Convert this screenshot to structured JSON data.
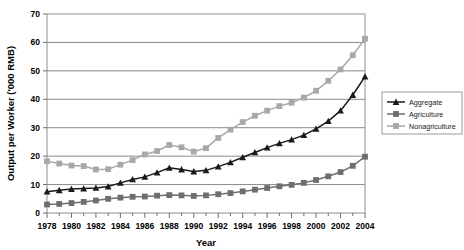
{
  "chart_data": {
    "type": "line",
    "title": "",
    "xlabel": "Year",
    "ylabel": "Output per Worker ('000 RMB)",
    "xlim": [
      1978,
      2004
    ],
    "ylim": [
      0,
      70
    ],
    "ytick_step": 10,
    "xtick_step": 2,
    "grid": true,
    "legend_position": "right",
    "x": [
      1978,
      1979,
      1980,
      1981,
      1982,
      1983,
      1984,
      1985,
      1986,
      1987,
      1988,
      1989,
      1990,
      1991,
      1992,
      1993,
      1994,
      1995,
      1996,
      1997,
      1998,
      1999,
      2000,
      2001,
      2002,
      2003,
      2004
    ],
    "xtick_labels": [
      "1978",
      "1980",
      "1982",
      "1984",
      "1986",
      "1988",
      "1990",
      "1992",
      "1994",
      "1996",
      "1998",
      "2000",
      "2002",
      "2004"
    ],
    "ytick_labels": [
      "0",
      "10",
      "20",
      "30",
      "40",
      "50",
      "60",
      "70"
    ],
    "series": [
      {
        "name": "Aggregate",
        "color": "#1a1a1a",
        "marker": "triangle",
        "values": [
          7.5,
          8.0,
          8.4,
          8.6,
          8.8,
          9.3,
          10.6,
          11.8,
          12.7,
          14.2,
          15.9,
          15.3,
          14.6,
          15.0,
          16.3,
          17.8,
          19.6,
          21.3,
          23.0,
          24.5,
          25.8,
          27.4,
          29.6,
          32.3,
          36.0,
          41.5,
          48.0
        ]
      },
      {
        "name": "Agriculture",
        "color": "#6e6e6e",
        "marker": "square",
        "values": [
          3.0,
          3.2,
          3.5,
          3.9,
          4.4,
          5.0,
          5.4,
          5.7,
          5.8,
          6.1,
          6.3,
          6.2,
          6.0,
          6.2,
          6.6,
          7.0,
          7.6,
          8.2,
          8.8,
          9.4,
          9.9,
          10.6,
          11.6,
          12.9,
          14.4,
          16.6,
          19.8
        ]
      },
      {
        "name": "Nonagriculture",
        "color": "#a8a8a8",
        "marker": "square",
        "values": [
          18.2,
          17.4,
          16.7,
          16.5,
          15.3,
          15.4,
          17.0,
          18.6,
          20.6,
          21.8,
          23.9,
          23.1,
          21.6,
          22.8,
          26.4,
          29.3,
          32.0,
          34.2,
          36.0,
          37.6,
          38.8,
          40.6,
          43.0,
          46.5,
          50.5,
          55.5,
          61.3
        ]
      }
    ]
  },
  "legend": {
    "items": [
      {
        "label": "Aggregate"
      },
      {
        "label": "Agriculture"
      },
      {
        "label": "Nonagriculture"
      }
    ]
  }
}
